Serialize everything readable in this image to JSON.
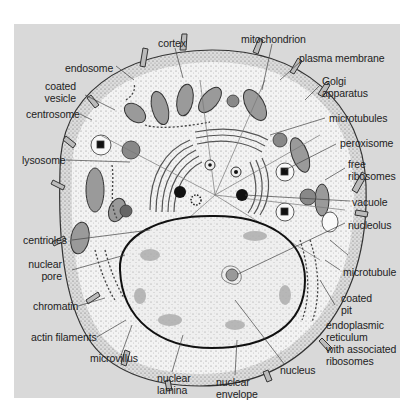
{
  "figure": {
    "background_color": "#d9d9d9",
    "cell_fill": "#f4f4f4",
    "nucleus_fill": "#ececec",
    "ink_color": "#222222"
  },
  "labels": {
    "cortex": "cortex",
    "mitochondrion": "mitochondrion",
    "plasma_membrane": "plasma membrane",
    "endosome": "endosome",
    "golgi_apparatus": "Golgi\napparatus",
    "coated_vesicle": "coated\nvesicle",
    "centrosome": "centrosome",
    "microtubules": "microtubules",
    "peroxisome": "peroxisome",
    "lysosome": "lysosome",
    "free_ribosomes": "free\nribosomes",
    "vacuole": "vacuole",
    "centrioles": "centrioles",
    "nucleolus": "nucleolus",
    "nuclear_pore": "nuclear\npore",
    "microtubule": "microtubule",
    "chromatin": "chromatin",
    "coated_pit": "coated\npit",
    "actin_filaments": "actin filaments",
    "endoplasmic_reticulum": "endoplasmic\nreticulum\nwith associated\nribosomes",
    "microvillus": "microvillus",
    "nucleus": "nucleus",
    "nuclear_lamina": "nuclear\nlamina",
    "nuclear_envelope": "nuclear\nenvelope"
  }
}
